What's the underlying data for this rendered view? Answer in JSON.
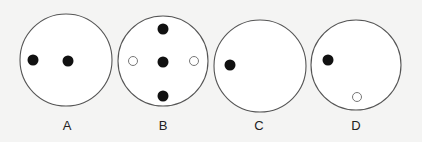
{
  "diagram": {
    "colors": {
      "background": "#f4f4f3",
      "circle_stroke": "#555555",
      "filled_dot": "#111111",
      "hollow_dot_stroke": "#777777",
      "hollow_dot_fill": "#ffffff"
    },
    "panels": [
      {
        "label": "A",
        "circle": {
          "cx": 66,
          "cy": 60,
          "r": 46
        },
        "filled_dots": [
          {
            "cx": 33,
            "cy": 60
          },
          {
            "cx": 68,
            "cy": 61
          }
        ],
        "hollow_dots": []
      },
      {
        "label": "B",
        "circle": {
          "cx": 163,
          "cy": 61,
          "r": 45
        },
        "filled_dots": [
          {
            "cx": 163,
            "cy": 29
          },
          {
            "cx": 163,
            "cy": 62
          },
          {
            "cx": 163,
            "cy": 96
          }
        ],
        "hollow_dots": [
          {
            "cx": 133,
            "cy": 61
          },
          {
            "cx": 194,
            "cy": 61
          }
        ]
      },
      {
        "label": "C",
        "circle": {
          "cx": 260,
          "cy": 66,
          "r": 46
        },
        "filled_dots": [
          {
            "cx": 230,
            "cy": 65
          }
        ],
        "hollow_dots": []
      },
      {
        "label": "D",
        "circle": {
          "cx": 356,
          "cy": 65,
          "r": 45
        },
        "filled_dots": [
          {
            "cx": 328,
            "cy": 60
          }
        ],
        "hollow_dots": [
          {
            "cx": 357,
            "cy": 97
          }
        ]
      }
    ]
  }
}
